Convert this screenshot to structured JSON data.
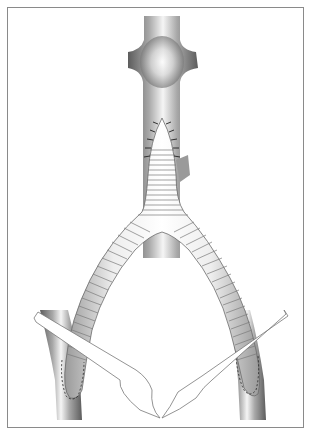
{
  "figure": {
    "caption": "",
    "colors": {
      "frame": "#8a8a8a",
      "vessel_dark": "#6e6e6e",
      "vessel_light": "#f4f4f4",
      "graft_fill": "#f7f7f7",
      "graft_ridge": "#7a7a7a",
      "suture": "#222222",
      "ligament": "#ffffff"
    },
    "labels": {
      "aorta": "aorta",
      "graft": "bifurcated graft",
      "left_limb": "left graft limb",
      "right_limb": "right graft limb",
      "inguinal_ligament": "inguinal ligament",
      "femoral_artery_left": "left femoral artery",
      "femoral_artery_right": "right femoral artery"
    }
  }
}
